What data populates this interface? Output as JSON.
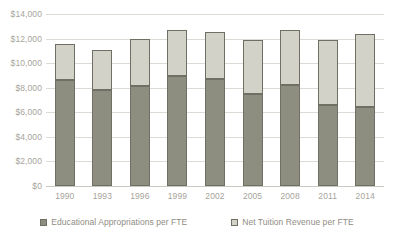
{
  "chart_data": {
    "type": "bar",
    "subtype": "stacked-vertical",
    "title": "",
    "subtitle": "",
    "xlabel": "",
    "ylabel": "",
    "ylim": [
      0,
      14000
    ],
    "ytick_step": 2000,
    "grid": true,
    "legend_position": "bottom",
    "categories": [
      "1990",
      "1993",
      "1996",
      "1999",
      "2002",
      "2005",
      "2008",
      "2011",
      "2014"
    ],
    "ytick_labels": [
      "$0",
      "$2,000",
      "$4,000",
      "$6,000",
      "$8,000",
      "$10,000",
      "$12,000",
      "$14,000"
    ],
    "ytick_values": [
      0,
      2000,
      4000,
      6000,
      8000,
      10000,
      12000,
      14000
    ],
    "series": [
      {
        "name": "Educational Appropriations per FTE",
        "color": "#8d8d80",
        "values": [
          8650,
          7800,
          8150,
          8950,
          8700,
          7500,
          8200,
          6600,
          6450
        ]
      },
      {
        "name": "Net Tuition Revenue per FTE",
        "color": "#d2d2c8",
        "values": [
          2950,
          3300,
          3800,
          3750,
          3850,
          4350,
          4500,
          5250,
          5950
        ]
      }
    ],
    "totals": [
      11600,
      11100,
      11950,
      12700,
      12550,
      11850,
      12700,
      11850,
      12400
    ]
  },
  "legend": {
    "entries": [
      {
        "label": "Educational Appropriations per FTE",
        "color": "#8d8d80"
      },
      {
        "label": "Net Tuition Revenue per FTE",
        "color": "#d2d2c8"
      }
    ]
  },
  "colors": {
    "series_dark": "#8d8d80",
    "series_light": "#d2d2c8",
    "bar_border": "#6f6f63",
    "gridline": "#dcdcd6",
    "axis_text": "#a6a49b",
    "legend_text": "#8f8d84",
    "background": "#ffffff"
  }
}
